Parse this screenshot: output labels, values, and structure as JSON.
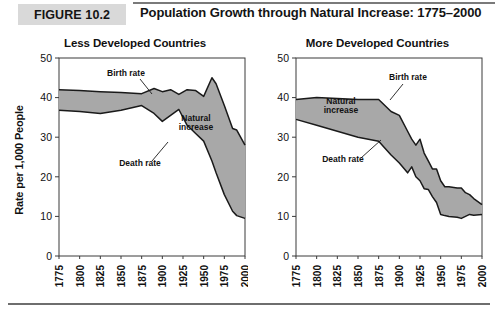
{
  "header": {
    "badge": "FIGURE 10.2",
    "title": "Population Growth through Natural Increase: 1775–2000"
  },
  "chart_data": [
    {
      "type": "area",
      "title": "Less Developed Countries",
      "xlabel": "",
      "ylabel": "Rate per 1,000 People",
      "xlim": [
        1775,
        2000
      ],
      "ylim": [
        0,
        50
      ],
      "yticks": [
        0,
        10,
        20,
        30,
        40,
        50
      ],
      "xticks": [
        1775,
        1800,
        1825,
        1850,
        1875,
        1900,
        1925,
        1950,
        1975,
        2000
      ],
      "grid": false,
      "legend_position": "inline-annotations",
      "annotations": [
        "Birth rate",
        "Death rate",
        "Natural increase"
      ],
      "fill_color": "#a8a8a8",
      "x": [
        1775,
        1800,
        1825,
        1850,
        1875,
        1890,
        1900,
        1910,
        1920,
        1930,
        1940,
        1950,
        1960,
        1965,
        1975,
        1985,
        1990,
        2000
      ],
      "series": [
        {
          "name": "Birth rate",
          "values": [
            42,
            41.8,
            41.5,
            41.3,
            41.0,
            42.3,
            41.5,
            42.0,
            40.8,
            42.0,
            41.8,
            40.3,
            45.0,
            43.5,
            38.0,
            32.2,
            31.8,
            28.0
          ]
        },
        {
          "name": "Death rate",
          "values": [
            36.8,
            36.5,
            36.0,
            36.8,
            38.0,
            36.0,
            34.0,
            35.5,
            37.0,
            33.0,
            31.0,
            29.0,
            24.0,
            21.0,
            15.5,
            11.3,
            10.2,
            9.5
          ]
        }
      ]
    },
    {
      "type": "area",
      "title": "More Developed Countries",
      "xlabel": "",
      "ylabel": "Rate per 1,000 People",
      "xlim": [
        1775,
        2000
      ],
      "ylim": [
        0,
        50
      ],
      "yticks": [
        0,
        10,
        20,
        30,
        40,
        50
      ],
      "xticks": [
        1775,
        1800,
        1825,
        1850,
        1875,
        1900,
        1925,
        1950,
        1975,
        2000
      ],
      "grid": false,
      "legend_position": "inline-annotations",
      "annotations": [
        "Birth rate",
        "Death rate",
        "Natural increase"
      ],
      "fill_color": "#a8a8a8",
      "x": [
        1775,
        1800,
        1825,
        1850,
        1875,
        1890,
        1900,
        1910,
        1915,
        1920,
        1925,
        1930,
        1935,
        1940,
        1945,
        1950,
        1955,
        1960,
        1970,
        1975,
        1980,
        1985,
        1990,
        2000
      ],
      "series": [
        {
          "name": "Birth rate",
          "values": [
            39.5,
            40.0,
            39.8,
            39.5,
            39.5,
            36.5,
            35.5,
            31.5,
            29.5,
            28.0,
            29.5,
            26.0,
            24.0,
            22.0,
            22.0,
            19.0,
            17.5,
            17.5,
            17.2,
            17.2,
            16.0,
            15.5,
            14.5,
            13.0
          ]
        },
        {
          "name": "Death rate",
          "values": [
            34.5,
            33.0,
            31.5,
            30.0,
            29.0,
            25.5,
            23.5,
            21.0,
            22.5,
            20.0,
            19.0,
            17.0,
            16.8,
            15.0,
            13.5,
            10.5,
            10.2,
            10.0,
            9.8,
            9.5,
            10.0,
            10.5,
            10.3,
            10.5
          ]
        }
      ]
    }
  ],
  "axis_labels": {
    "y_axis_title": "Rate per 1,000 People"
  }
}
